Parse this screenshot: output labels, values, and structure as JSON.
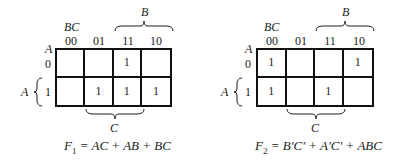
{
  "maps": [
    {
      "id": "f1",
      "var_row": "A",
      "var_col": "BC",
      "col_labels": [
        "00",
        "01",
        "11",
        "10"
      ],
      "row_labels": [
        "0",
        "1"
      ],
      "cells": [
        [
          "",
          "",
          "1",
          ""
        ],
        [
          "",
          "1",
          "1",
          "1"
        ]
      ],
      "brace_top": "B",
      "brace_bottom": "C",
      "brace_left": "A",
      "function_name": "F",
      "function_sub": "1",
      "function_expr": " = AC + AB + BC"
    },
    {
      "id": "f2",
      "var_row": "A",
      "var_col": "BC",
      "col_labels": [
        "00",
        "01",
        "11",
        "10"
      ],
      "row_labels": [
        "0",
        "1"
      ],
      "cells": [
        [
          "1",
          "",
          "",
          "1"
        ],
        [
          "1",
          "",
          "1",
          ""
        ]
      ],
      "brace_top": "B",
      "brace_bottom": "C",
      "brace_left": "A",
      "function_name": "F",
      "function_sub": "2",
      "function_expr": " = B′C′ + A′C′ + ABC"
    }
  ]
}
